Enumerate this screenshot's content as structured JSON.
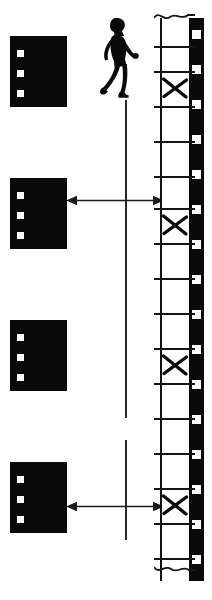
{
  "figure": {
    "width": 212,
    "height": 600,
    "background_color": "#ffffff",
    "ink_color": "#0a0a0a"
  },
  "walker": {
    "label": "walking person silhouette",
    "x": 93,
    "y": 17,
    "width": 46,
    "height": 83,
    "color": "#0a0a0a"
  },
  "reference_line": {
    "label": "vertical reference line",
    "x": 125,
    "color": "#2a2a2a",
    "segments": [
      {
        "top": 100,
        "bottom": 418
      },
      {
        "top": 440,
        "bottom": 540
      }
    ]
  },
  "slides": [
    {
      "name": "slide-1",
      "x": 10,
      "y": 36,
      "width": 57,
      "height": 71,
      "holes_y": [
        14,
        34,
        54
      ]
    },
    {
      "name": "slide-2",
      "x": 10,
      "y": 178,
      "width": 57,
      "height": 71,
      "holes_y": [
        14,
        34,
        54
      ]
    },
    {
      "name": "slide-3",
      "x": 10,
      "y": 320,
      "width": 57,
      "height": 71,
      "holes_y": [
        14,
        34,
        54
      ]
    },
    {
      "name": "slide-4",
      "x": 10,
      "y": 462,
      "width": 57,
      "height": 71,
      "holes_y": [
        14,
        34,
        54
      ]
    }
  ],
  "arrows": [
    {
      "name": "arrow-slide2-to-frame2",
      "x": 68,
      "y": 200,
      "width": 95,
      "style": "double-headed",
      "color": "#1a1a1a"
    },
    {
      "name": "arrow-slide4-to-frame4",
      "x": 68,
      "y": 500,
      "width": 95,
      "style": "double-headed",
      "color": "#1a1a1a"
    }
  ],
  "filmstrip": {
    "label": "35mm film strip",
    "x": 160,
    "y": 18,
    "width": 44,
    "height": 563,
    "edge_color": "#0a0a0a",
    "edge_width": 14,
    "sprocket_color": "#ffffff",
    "sprocket_count": 16,
    "frame_height": 35,
    "torn_top": true,
    "torn_bottom": true,
    "marked_frames": [
      1,
      5,
      10,
      14
    ],
    "marked_symbol": "X",
    "frames": [
      {
        "index": 0,
        "top": 28,
        "marked": false
      },
      {
        "index": 1,
        "top": 53,
        "marked": true
      },
      {
        "index": 2,
        "top": 88,
        "marked": false
      },
      {
        "index": 3,
        "top": 123,
        "marked": false
      },
      {
        "index": 4,
        "top": 158,
        "marked": false
      },
      {
        "index": 5,
        "top": 190,
        "marked": true
      },
      {
        "index": 6,
        "top": 225,
        "marked": false
      },
      {
        "index": 7,
        "top": 260,
        "marked": false
      },
      {
        "index": 8,
        "top": 295,
        "marked": false
      },
      {
        "index": 9,
        "top": 325,
        "marked": false
      },
      {
        "index": 10,
        "top": 332,
        "marked": true
      },
      {
        "index": 11,
        "top": 367,
        "marked": false
      },
      {
        "index": 12,
        "top": 400,
        "marked": false
      },
      {
        "index": 13,
        "top": 435,
        "marked": false
      },
      {
        "index": 14,
        "top": 470,
        "marked": true
      },
      {
        "index": 15,
        "top": 505,
        "marked": false
      },
      {
        "index": 16,
        "top": 540,
        "marked": false
      }
    ]
  }
}
